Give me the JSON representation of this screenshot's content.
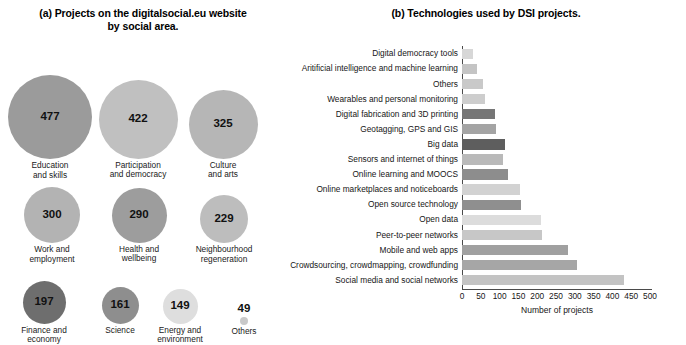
{
  "figure": {
    "panel_a": {
      "title": "(a) Projects on the digitalsocial.eu website by social area.",
      "title_line1": "(a) Projects on the digitalsocial.eu website",
      "title_line2": "by social area."
    },
    "panel_b": {
      "title": "(b) Technologies used by DSI projects."
    }
  },
  "chart_data": [
    {
      "type": "bubble",
      "title": "(a) Projects on the digitalsocial.eu website by social area.",
      "xlabel": "",
      "ylabel": "",
      "legend": "none",
      "grid": false,
      "value_unit": "projects",
      "categories": [
        "Education and skills",
        "Participation and democracy",
        "Culture and arts",
        "Work and employment",
        "Health and wellbeing",
        "Neighbourhood regeneration",
        "Finance and economy",
        "Science",
        "Energy and environment",
        "Others"
      ],
      "values": [
        477,
        422,
        325,
        300,
        290,
        229,
        197,
        161,
        149,
        49
      ],
      "bubbles": [
        {
          "label_line1": "Education",
          "label_line2": "and skills",
          "value": "477",
          "size": 84,
          "color": "#9b9b9b",
          "cx": 50,
          "cy": 85,
          "row": 1
        },
        {
          "label_line1": "Participation",
          "label_line2": "and democracy",
          "value": "422",
          "size": 79,
          "color": "#c0c0c0",
          "cx": 138,
          "cy": 87,
          "row": 1
        },
        {
          "label_line1": "Culture",
          "label_line2": "and arts",
          "value": "325",
          "size": 69,
          "color": "#b6b6b6",
          "cx": 223,
          "cy": 92,
          "row": 1
        },
        {
          "label_line1": "Work and",
          "label_line2": "employment",
          "value": "300",
          "size": 56,
          "color": "#b3b3b3",
          "cx": 52,
          "cy": 183,
          "row": 2
        },
        {
          "label_line1": "Health and",
          "label_line2": "wellbeing",
          "value": "290",
          "size": 55,
          "color": "#9d9d9d",
          "cx": 139,
          "cy": 183,
          "row": 2
        },
        {
          "label_line1": "Neighbourhood",
          "label_line2": "regeneration",
          "value": "229",
          "size": 48,
          "color": "#bdbdbd",
          "cx": 224,
          "cy": 187,
          "row": 2
        },
        {
          "label_line1": "Finance and",
          "label_line2": "economy",
          "value": "197",
          "size": 43,
          "color": "#6e6e6e",
          "cx": 44,
          "cy": 270,
          "row": 3
        },
        {
          "label_line1": "Science",
          "label_line2": "",
          "value": "161",
          "size": 37,
          "color": "#8e8e8e",
          "cx": 120,
          "cy": 273,
          "row": 3
        },
        {
          "label_line1": "Energy and",
          "label_line2": "environment",
          "value": "149",
          "size": 35,
          "color": "#dedede",
          "cx": 180,
          "cy": 274,
          "row": 3
        },
        {
          "label_line1": "Others",
          "label_line2": "",
          "value": "49",
          "size": 8,
          "color": "#c9c9c9",
          "cx": 244,
          "cy": 283,
          "row": 3
        }
      ]
    },
    {
      "type": "bar",
      "orientation": "horizontal",
      "title": "(b) Technologies used by DSI projects.",
      "xlabel": "Number of projects",
      "ylabel": "",
      "grid": false,
      "legend": "none",
      "xlim": [
        0,
        500
      ],
      "xticks": [
        0,
        50,
        100,
        150,
        200,
        250,
        300,
        350,
        400,
        450,
        500
      ],
      "xtick_labels": [
        "0",
        "50",
        "100",
        "150",
        "200",
        "250",
        "300",
        "350",
        "400",
        "450",
        "500"
      ],
      "categories": [
        "Digital democracy tools",
        "Aritificial intelligence and machine learning",
        "Others",
        "Wearables and personal monitoring",
        "Digital fabrication and 3D printing",
        "Geotagging, GPS and GIS",
        "Big data",
        "Sensors and internet of things",
        "Online learning and MOOCS",
        "Online marketplaces and noticeboards",
        "Open source technology",
        "Open data",
        "Peer-to-peer networks",
        "Mobile and web apps",
        "Crowdsourcing, crowdmapping, crowdfunding",
        "Social media and social networks"
      ],
      "values": [
        30,
        40,
        55,
        62,
        88,
        90,
        115,
        110,
        122,
        155,
        157,
        210,
        213,
        283,
        305,
        430
      ],
      "bar_colors": [
        "#d7d7d7",
        "#c4c4c4",
        "#c9c9c9",
        "#cdcdcd",
        "#767676",
        "#a4a4a4",
        "#5e5e5e",
        "#b9b9b9",
        "#8d8d8d",
        "#d2d2d2",
        "#8f8f8f",
        "#dcdcdc",
        "#c7c7c7",
        "#a0a0a0",
        "#a6a6a6",
        "#c3c3c3"
      ]
    }
  ]
}
